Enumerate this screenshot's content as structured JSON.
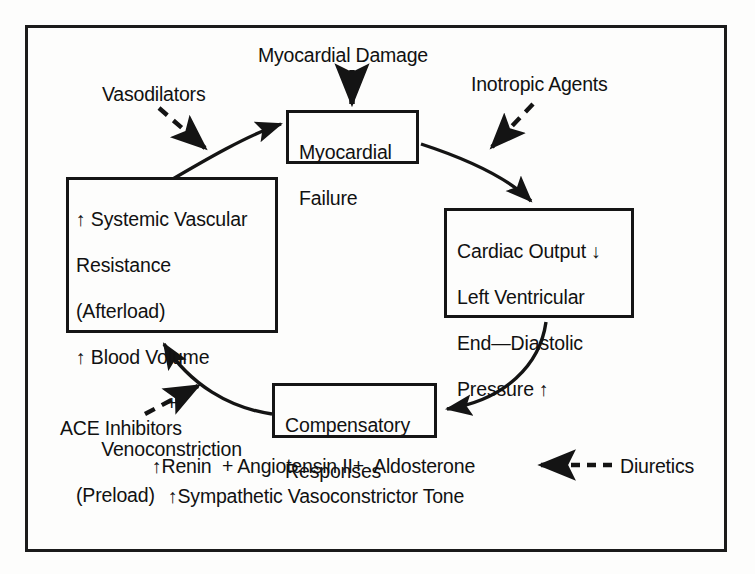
{
  "diagram": {
    "frame_color": "#1b1b1b",
    "nodes": {
      "myocardial_failure": {
        "lines": [
          "Myocardial",
          "Failure"
        ]
      },
      "cardiac_output": {
        "lines": [
          "Cardiac Output ↓",
          "Left Ventricular",
          "End—Diastolic",
          "Pressure ↑"
        ]
      },
      "compensatory_responses": {
        "lines": [
          "Compensatory",
          "Responses"
        ]
      },
      "systemic_vascular_resistance": {
        "lines": [
          "↑ Systemic Vascular",
          "Resistance",
          "(Afterload)",
          "↑ Blood Volume",
          "+",
          "Venoconstriction",
          "(Preload)"
        ]
      }
    },
    "labels": {
      "myocardial_damage": "Myocardial Damage",
      "vasodilators": "Vasodilators",
      "inotropic_agents": "Inotropic Agents",
      "ace_inhibitors": "ACE Inhibitors",
      "diuretics": "Diuretics"
    },
    "mediators": {
      "renin_line": "↑Renin  + Angiotensin II+  Aldosterone",
      "sympathetic_line": "↑Sympathetic Vasoconstrictor Tone"
    },
    "edges": [
      {
        "name": "damage-to-failure",
        "from": "Myocardial Damage",
        "to": "Myocardial Failure",
        "style": "solid",
        "arrow": true
      },
      {
        "name": "failure-to-cardiac-output",
        "from": "Myocardial Failure",
        "to": "Cardiac Output",
        "style": "solid-curve",
        "arrow": true
      },
      {
        "name": "cardiac-output-to-compensatory",
        "from": "Cardiac Output",
        "to": "Compensatory Responses",
        "style": "solid-curve",
        "arrow": true
      },
      {
        "name": "compensatory-to-svr",
        "from": "Compensatory Responses",
        "to": "Systemic Vascular Resistance",
        "style": "solid-curve",
        "arrow": true
      },
      {
        "name": "svr-to-failure",
        "from": "Systemic Vascular Resistance",
        "to": "Myocardial Failure",
        "style": "solid-curve",
        "arrow": true
      },
      {
        "name": "vasodilators-inhibition",
        "from": "Vasodilators",
        "to": "svr-to-failure edge",
        "style": "dashed",
        "arrow": true
      },
      {
        "name": "inotropic-agents-action",
        "from": "Inotropic Agents",
        "to": "failure-to-cardiac-output edge",
        "style": "dashed",
        "arrow": true
      },
      {
        "name": "ace-inhibitors-action",
        "from": "ACE Inhibitors",
        "to": "compensatory-to-svr edge",
        "style": "dashed",
        "arrow": true
      },
      {
        "name": "diuretics-action",
        "from": "Diuretics",
        "to": "Aldosterone",
        "style": "dashed",
        "arrow": true
      }
    ]
  }
}
